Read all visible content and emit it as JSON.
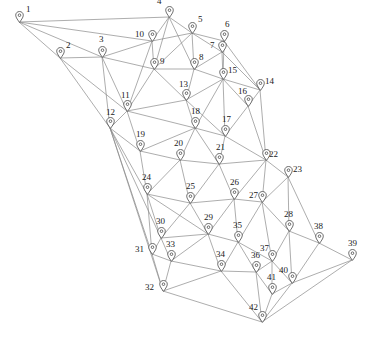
{
  "diagram": {
    "type": "graph-network",
    "background_color": "#ffffff",
    "edge_color": "#8a8a8a",
    "node_icon": "map-pin-icon",
    "label_color": "#1a1a1a",
    "width": 374,
    "height": 348,
    "node_count": 42,
    "edge_count": 111
  },
  "nodes": [
    {
      "id": 1,
      "label": "1",
      "x": 19,
      "y": 22,
      "label_dx": 7,
      "label_dy": -17
    },
    {
      "id": 2,
      "label": "2",
      "x": 60,
      "y": 58,
      "label_dx": 6,
      "label_dy": -17
    },
    {
      "id": 3,
      "label": "3",
      "x": 102,
      "y": 57,
      "label_dx": -3,
      "label_dy": -22
    },
    {
      "id": 4,
      "label": "4",
      "x": 169,
      "y": 17,
      "label_dx": -12,
      "label_dy": -20
    },
    {
      "id": 5,
      "label": "5",
      "x": 192,
      "y": 33,
      "label_dx": 6,
      "label_dy": -18
    },
    {
      "id": 6,
      "label": "6",
      "x": 224,
      "y": 41,
      "label_dx": 1,
      "label_dy": -21
    },
    {
      "id": 7,
      "label": "7",
      "x": 222,
      "y": 52,
      "label_dx": -12,
      "label_dy": -11
    },
    {
      "id": 8,
      "label": "8",
      "x": 194,
      "y": 69,
      "label_dx": 5,
      "label_dy": -16
    },
    {
      "id": 9,
      "label": "9",
      "x": 154,
      "y": 69,
      "label_dx": 6,
      "label_dy": -12
    },
    {
      "id": 10,
      "label": "10",
      "x": 152,
      "y": 41,
      "label_dx": -17,
      "label_dy": -11
    },
    {
      "id": 11,
      "label": "11",
      "x": 127,
      "y": 111,
      "label_dx": -6,
      "label_dy": -20
    },
    {
      "id": 12,
      "label": "12",
      "x": 110,
      "y": 128,
      "label_dx": -4,
      "label_dy": -20
    },
    {
      "id": 13,
      "label": "13",
      "x": 186,
      "y": 100,
      "label_dx": -7,
      "label_dy": -20
    },
    {
      "id": 14,
      "label": "14",
      "x": 260,
      "y": 90,
      "label_dx": 5,
      "label_dy": -13
    },
    {
      "id": 15,
      "label": "15",
      "x": 223,
      "y": 79,
      "label_dx": 5,
      "label_dy": -13
    },
    {
      "id": 16,
      "label": "16",
      "x": 248,
      "y": 106,
      "label_dx": -10,
      "label_dy": -19
    },
    {
      "id": 17,
      "label": "17",
      "x": 225,
      "y": 136,
      "label_dx": -3,
      "label_dy": -21
    },
    {
      "id": 18,
      "label": "18",
      "x": 195,
      "y": 128,
      "label_dx": -4,
      "label_dy": -21
    },
    {
      "id": 19,
      "label": "19",
      "x": 140,
      "y": 151,
      "label_dx": -4,
      "label_dy": -21
    },
    {
      "id": 20,
      "label": "20",
      "x": 180,
      "y": 160,
      "label_dx": -6,
      "label_dy": -21
    },
    {
      "id": 21,
      "label": "21",
      "x": 219,
      "y": 164,
      "label_dx": -3,
      "label_dy": -21
    },
    {
      "id": 22,
      "label": "22",
      "x": 266,
      "y": 160,
      "label_dx": 3,
      "label_dy": -10
    },
    {
      "id": 23,
      "label": "23",
      "x": 288,
      "y": 177,
      "label_dx": 5,
      "label_dy": -12
    },
    {
      "id": 24,
      "label": "24",
      "x": 147,
      "y": 194,
      "label_dx": -5,
      "label_dy": -21
    },
    {
      "id": 25,
      "label": "25",
      "x": 190,
      "y": 203,
      "label_dx": -4,
      "label_dy": -21
    },
    {
      "id": 26,
      "label": "26",
      "x": 234,
      "y": 199,
      "label_dx": -4,
      "label_dy": -21
    },
    {
      "id": 27,
      "label": "27",
      "x": 262,
      "y": 202,
      "label_dx": -13,
      "label_dy": -11
    },
    {
      "id": 28,
      "label": "28",
      "x": 289,
      "y": 231,
      "label_dx": -5,
      "label_dy": -21
    },
    {
      "id": 29,
      "label": "29",
      "x": 208,
      "y": 234,
      "label_dx": -4,
      "label_dy": -21
    },
    {
      "id": 30,
      "label": "30",
      "x": 161,
      "y": 238,
      "label_dx": -5,
      "label_dy": -21
    },
    {
      "id": 31,
      "label": "31",
      "x": 152,
      "y": 254,
      "label_dx": -17,
      "label_dy": -9
    },
    {
      "id": 32,
      "label": "32",
      "x": 163,
      "y": 291,
      "label_dx": -18,
      "label_dy": -8
    },
    {
      "id": 33,
      "label": "33",
      "x": 171,
      "y": 261,
      "label_dx": -5,
      "label_dy": -21
    },
    {
      "id": 34,
      "label": "34",
      "x": 221,
      "y": 271,
      "label_dx": -5,
      "label_dy": -21
    },
    {
      "id": 35,
      "label": "35",
      "x": 238,
      "y": 242,
      "label_dx": -5,
      "label_dy": -21
    },
    {
      "id": 36,
      "label": "36",
      "x": 256,
      "y": 272,
      "label_dx": -5,
      "label_dy": -21
    },
    {
      "id": 37,
      "label": "37",
      "x": 272,
      "y": 261,
      "label_dx": -12,
      "label_dy": -17
    },
    {
      "id": 38,
      "label": "38",
      "x": 319,
      "y": 243,
      "label_dx": -5,
      "label_dy": -21
    },
    {
      "id": 39,
      "label": "39",
      "x": 352,
      "y": 260,
      "label_dx": -4,
      "label_dy": -21
    },
    {
      "id": 40,
      "label": "40",
      "x": 292,
      "y": 283,
      "label_dx": -13,
      "label_dy": -17
    },
    {
      "id": 41,
      "label": "41",
      "x": 272,
      "y": 294,
      "label_dx": -5,
      "label_dy": -21
    },
    {
      "id": 42,
      "label": "42",
      "x": 262,
      "y": 322,
      "label_dx": -13,
      "label_dy": -19
    }
  ],
  "edges": [
    [
      1,
      2
    ],
    [
      1,
      3
    ],
    [
      1,
      10
    ],
    [
      1,
      4
    ],
    [
      2,
      3
    ],
    [
      2,
      12
    ],
    [
      2,
      11
    ],
    [
      3,
      10
    ],
    [
      3,
      9
    ],
    [
      3,
      12
    ],
    [
      3,
      11
    ],
    [
      4,
      10
    ],
    [
      4,
      5
    ],
    [
      4,
      9
    ],
    [
      4,
      8
    ],
    [
      5,
      6
    ],
    [
      5,
      8
    ],
    [
      5,
      9
    ],
    [
      5,
      7
    ],
    [
      5,
      10
    ],
    [
      6,
      7
    ],
    [
      6,
      15
    ],
    [
      6,
      14
    ],
    [
      7,
      15
    ],
    [
      7,
      8
    ],
    [
      7,
      14
    ],
    [
      8,
      9
    ],
    [
      8,
      13
    ],
    [
      8,
      15
    ],
    [
      9,
      10
    ],
    [
      9,
      13
    ],
    [
      9,
      11
    ],
    [
      10,
      11
    ],
    [
      11,
      12
    ],
    [
      11,
      13
    ],
    [
      11,
      18
    ],
    [
      11,
      19
    ],
    [
      12,
      19
    ],
    [
      12,
      24
    ],
    [
      12,
      30
    ],
    [
      12,
      31
    ],
    [
      12,
      32
    ],
    [
      13,
      18
    ],
    [
      13,
      15
    ],
    [
      13,
      17
    ],
    [
      14,
      16
    ],
    [
      14,
      15
    ],
    [
      14,
      22
    ],
    [
      15,
      16
    ],
    [
      15,
      17
    ],
    [
      15,
      18
    ],
    [
      16,
      17
    ],
    [
      16,
      22
    ],
    [
      17,
      18
    ],
    [
      17,
      21
    ],
    [
      17,
      22
    ],
    [
      18,
      19
    ],
    [
      18,
      20
    ],
    [
      18,
      21
    ],
    [
      19,
      20
    ],
    [
      19,
      24
    ],
    [
      20,
      21
    ],
    [
      20,
      24
    ],
    [
      20,
      25
    ],
    [
      21,
      22
    ],
    [
      21,
      25
    ],
    [
      21,
      26
    ],
    [
      22,
      23
    ],
    [
      22,
      26
    ],
    [
      22,
      27
    ],
    [
      23,
      27
    ],
    [
      23,
      28
    ],
    [
      23,
      38
    ],
    [
      24,
      25
    ],
    [
      24,
      30
    ],
    [
      24,
      31
    ],
    [
      24,
      29
    ],
    [
      25,
      26
    ],
    [
      25,
      29
    ],
    [
      25,
      30
    ],
    [
      26,
      27
    ],
    [
      26,
      35
    ],
    [
      26,
      29
    ],
    [
      27,
      28
    ],
    [
      27,
      35
    ],
    [
      27,
      37
    ],
    [
      28,
      37
    ],
    [
      28,
      38
    ],
    [
      28,
      40
    ],
    [
      29,
      30
    ],
    [
      29,
      33
    ],
    [
      29,
      34
    ],
    [
      29,
      35
    ],
    [
      30,
      31
    ],
    [
      30,
      33
    ],
    [
      31,
      32
    ],
    [
      31,
      33
    ],
    [
      32,
      33
    ],
    [
      32,
      34
    ],
    [
      32,
      42
    ],
    [
      33,
      34
    ],
    [
      34,
      35
    ],
    [
      34,
      36
    ],
    [
      34,
      42
    ],
    [
      35,
      36
    ],
    [
      35,
      37
    ],
    [
      36,
      37
    ],
    [
      36,
      41
    ],
    [
      36,
      42
    ],
    [
      37,
      40
    ],
    [
      37,
      41
    ],
    [
      38,
      39
    ],
    [
      38,
      40
    ],
    [
      39,
      40
    ],
    [
      39,
      42
    ],
    [
      40,
      41
    ],
    [
      40,
      42
    ],
    [
      41,
      42
    ]
  ]
}
